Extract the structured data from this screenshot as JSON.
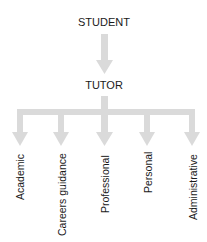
{
  "diagram": {
    "root": {
      "label": "STUDENT"
    },
    "middle": {
      "label": "TUTOR"
    },
    "leaves": [
      {
        "label": "Academic"
      },
      {
        "label": "Careers guidance"
      },
      {
        "label": "Professional"
      },
      {
        "label": "Personal"
      },
      {
        "label": "Administrative"
      }
    ],
    "colors": {
      "arrow": "#dadada",
      "text": "#1a1a1a",
      "background": "#ffffff"
    }
  }
}
